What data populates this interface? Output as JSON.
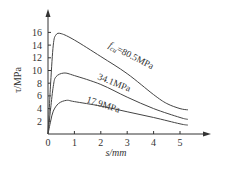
{
  "chart_data": {
    "type": "line",
    "title": "",
    "xlabel": "s/mm",
    "ylabel": "τ/MPa",
    "xlim": [
      0,
      5.8
    ],
    "ylim": [
      0,
      18
    ],
    "x_ticks": [
      "0",
      "1",
      "2",
      "3",
      "4",
      "5"
    ],
    "y_ticks": [
      "2",
      "4",
      "6",
      "8",
      "10",
      "12",
      "14",
      "16"
    ],
    "grid": false,
    "series": [
      {
        "name": "f_cu=80.5MPa",
        "label": "fcu=80.5MPa",
        "x": [
          0,
          0.1,
          0.2,
          0.3,
          0.5,
          1,
          2,
          3,
          4,
          4.5,
          5,
          5.3
        ],
        "y": [
          0,
          8,
          14,
          15.6,
          15.8,
          14.8,
          12.2,
          9.5,
          6.2,
          4.8,
          4.0,
          3.8
        ]
      },
      {
        "name": "34.1MPa",
        "label": "34.1MPa",
        "x": [
          0,
          0.1,
          0.2,
          0.3,
          0.6,
          1,
          2,
          3,
          4,
          5,
          5.3
        ],
        "y": [
          0,
          4,
          7.5,
          9.0,
          9.6,
          9.2,
          7.8,
          5.8,
          4.0,
          2.6,
          2.3
        ]
      },
      {
        "name": "17.9MPa",
        "label": "17.9MPa",
        "x": [
          0,
          0.1,
          0.2,
          0.4,
          0.7,
          1,
          2,
          3,
          4,
          5,
          5.3
        ],
        "y": [
          0,
          2,
          3.6,
          4.8,
          5.3,
          5.1,
          4.4,
          3.5,
          2.6,
          1.6,
          1.4
        ]
      }
    ]
  },
  "labels": {
    "xlabel": "s/mm",
    "ylabel": "τ/MPa",
    "ann_prefix": "f",
    "ann_sub": "cu",
    "ann_80": "=80.5MPa",
    "ann_34": "34.1MPa",
    "ann_17": "17.9MPa"
  }
}
